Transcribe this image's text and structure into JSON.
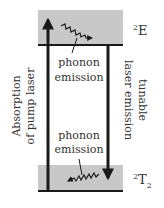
{
  "diagram": {
    "levels": [
      {
        "id": "upper",
        "label_main": "2",
        "label_sym": "E",
        "label_sub": ""
      },
      {
        "id": "lower",
        "label_main": "2",
        "label_sym": "T",
        "label_sub": "2"
      }
    ],
    "transitions": {
      "absorption_label_line1": "Absorption",
      "absorption_label_line2": "of pump laser",
      "emission_label_line1": "tunable",
      "emission_label_line2": "laser emission"
    },
    "phonon_upper": {
      "line1": "phonon",
      "line2": "emission"
    },
    "phonon_lower": {
      "line1": "phonon",
      "line2": "emission"
    }
  },
  "colors": {
    "band_fill": "#c8c8c8",
    "line": "#1a1a1a",
    "text": "#333333"
  }
}
